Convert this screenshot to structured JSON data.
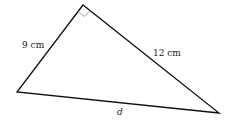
{
  "diagram": {
    "type": "right-triangle",
    "vertices": {
      "top": [
        83,
        5
      ],
      "left": [
        17,
        92
      ],
      "right": [
        219,
        113
      ]
    },
    "right_angle_at": "top",
    "labels": {
      "side_left": "9 cm",
      "side_right": "12 cm",
      "side_bottom": "d"
    },
    "colors": {
      "line": "#111111",
      "right_angle_marker": "#999999"
    }
  }
}
